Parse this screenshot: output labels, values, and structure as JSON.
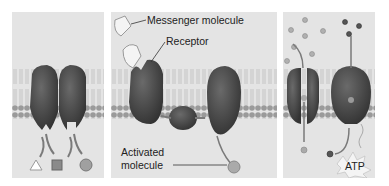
{
  "figure": {
    "panels": [
      {
        "id": "enzymatic",
        "labels": []
      },
      {
        "id": "signal-transduction",
        "labels": {
          "messenger": "Messenger molecule",
          "receptor": "Receptor",
          "activated_1": "Activated",
          "activated_2": "molecule"
        }
      },
      {
        "id": "transport",
        "labels": {
          "atp": "ATP"
        }
      }
    ],
    "colors": {
      "background": "#e4e4e4",
      "protein": "#4a4a4a",
      "lipid_head": "#9a9a9a",
      "arrow": "#7a7a7a"
    }
  }
}
